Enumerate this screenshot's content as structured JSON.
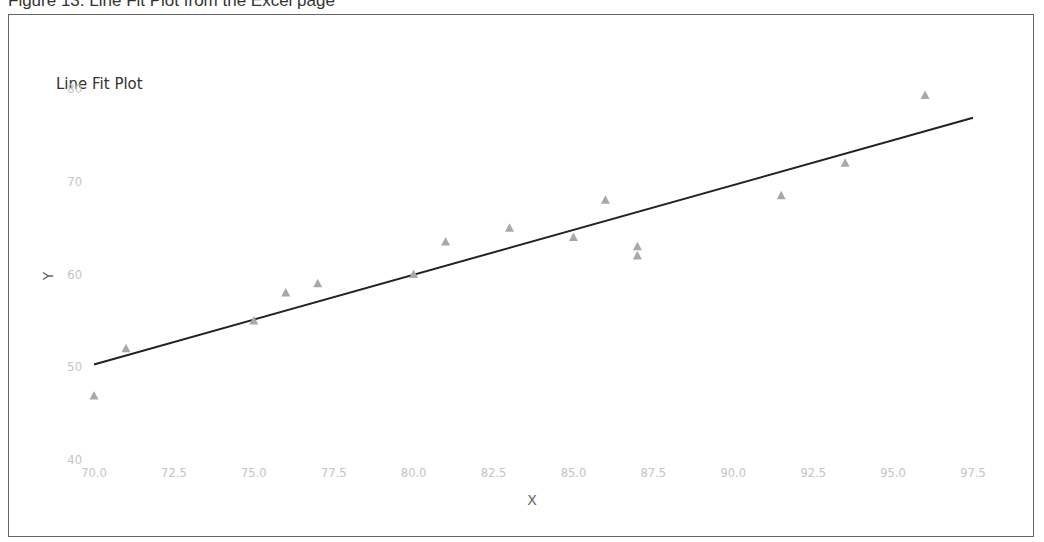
{
  "caption": "Figure 13: Line Fit Plot from the Excel page",
  "chart_data": {
    "type": "scatter",
    "title": "Line Fit Plot",
    "xlabel": "X",
    "ylabel": "Y",
    "xlim": [
      70.0,
      97.5
    ],
    "ylim": [
      40,
      80
    ],
    "x_ticks": [
      "70.0",
      "72.5",
      "75.0",
      "77.5",
      "80.0",
      "82.5",
      "85.0",
      "87.5",
      "90.0",
      "92.5",
      "95.0",
      "97.5"
    ],
    "y_ticks": [
      "40",
      "50",
      "60",
      "70",
      "80"
    ],
    "grid": false,
    "legend": null,
    "series": [
      {
        "name": "Y",
        "type": "scatter",
        "marker": "triangle",
        "color": "#a8a8a8",
        "points": [
          [
            70,
            46.9
          ],
          [
            71,
            52
          ],
          [
            75,
            55
          ],
          [
            76,
            58
          ],
          [
            77,
            59
          ],
          [
            80,
            60
          ],
          [
            81,
            63.5
          ],
          [
            83,
            65
          ],
          [
            85,
            64
          ],
          [
            86,
            68
          ],
          [
            87,
            63
          ],
          [
            87,
            62
          ],
          [
            91.5,
            68.5
          ],
          [
            93.5,
            72
          ],
          [
            96,
            79.3
          ]
        ]
      },
      {
        "name": "Predicted Y",
        "type": "line",
        "color": "#222222",
        "points": [
          [
            70,
            50.3
          ],
          [
            97.5,
            76.9
          ]
        ]
      }
    ]
  }
}
